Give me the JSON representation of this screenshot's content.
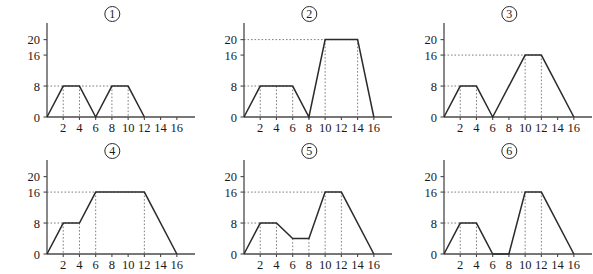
{
  "figure": {
    "panel_count": 6,
    "panel_labels": [
      "1",
      "2",
      "3",
      "4",
      "5",
      "6"
    ],
    "label_style": "circled-number"
  },
  "chart_data": [
    {
      "type": "line",
      "title": "1",
      "xlabel": "",
      "ylabel": "",
      "x": [
        0,
        2,
        4,
        6,
        8,
        10,
        12
      ],
      "y": [
        0,
        8,
        8,
        0,
        8,
        8,
        0
      ],
      "xticks": [
        2,
        4,
        6,
        8,
        10,
        12,
        14,
        16
      ],
      "yticks": [
        0,
        8,
        16,
        20
      ],
      "xlim": [
        0,
        17.5
      ],
      "ylim": [
        0,
        23
      ],
      "grid": false,
      "guide_lines_y": [
        8
      ],
      "guide_lines_x": [
        2,
        4,
        8,
        10
      ],
      "legend": ""
    },
    {
      "type": "line",
      "title": "2",
      "xlabel": "",
      "ylabel": "",
      "x": [
        0,
        2,
        6,
        8,
        10,
        14,
        16
      ],
      "y": [
        0,
        8,
        8,
        0,
        20,
        20,
        0
      ],
      "xticks": [
        2,
        4,
        6,
        8,
        10,
        12,
        14,
        16
      ],
      "yticks": [
        0,
        8,
        16,
        20
      ],
      "xlim": [
        0,
        17.5
      ],
      "ylim": [
        0,
        23
      ],
      "grid": false,
      "guide_lines_y": [
        8,
        20
      ],
      "guide_lines_x": [
        2,
        4,
        6,
        10,
        14
      ],
      "legend": ""
    },
    {
      "type": "line",
      "title": "3",
      "xlabel": "",
      "ylabel": "",
      "x": [
        0,
        2,
        4,
        6,
        10,
        12,
        16
      ],
      "y": [
        0,
        8,
        8,
        0,
        16,
        16,
        0
      ],
      "xticks": [
        2,
        4,
        6,
        8,
        10,
        12,
        14,
        16
      ],
      "yticks": [
        0,
        8,
        16,
        20
      ],
      "xlim": [
        0,
        17.5
      ],
      "ylim": [
        0,
        23
      ],
      "grid": false,
      "guide_lines_y": [
        8,
        16
      ],
      "guide_lines_x": [
        2,
        4,
        10,
        12
      ],
      "legend": ""
    },
    {
      "type": "line",
      "title": "4",
      "xlabel": "",
      "ylabel": "",
      "x": [
        0,
        2,
        4,
        6,
        12,
        16
      ],
      "y": [
        0,
        8,
        8,
        16,
        16,
        0
      ],
      "xticks": [
        2,
        4,
        6,
        8,
        10,
        12,
        14,
        16
      ],
      "yticks": [
        0,
        8,
        16,
        20
      ],
      "xlim": [
        0,
        17.5
      ],
      "ylim": [
        0,
        23
      ],
      "grid": false,
      "guide_lines_y": [
        8,
        16
      ],
      "guide_lines_x": [
        2,
        4,
        6,
        12
      ],
      "legend": ""
    },
    {
      "type": "line",
      "title": "5",
      "xlabel": "",
      "ylabel": "",
      "x": [
        0,
        2,
        4,
        6,
        8,
        10,
        12,
        16
      ],
      "y": [
        0,
        8,
        8,
        4,
        4,
        16,
        16,
        0
      ],
      "xticks": [
        2,
        4,
        6,
        8,
        10,
        12,
        14,
        16
      ],
      "yticks": [
        0,
        8,
        16,
        20
      ],
      "xlim": [
        0,
        17.5
      ],
      "ylim": [
        0,
        23
      ],
      "grid": false,
      "guide_lines_y": [
        8,
        16
      ],
      "guide_lines_x": [
        2,
        4,
        6,
        8,
        10,
        12
      ],
      "legend": ""
    },
    {
      "type": "line",
      "title": "6",
      "xlabel": "",
      "ylabel": "",
      "x": [
        0,
        2,
        4,
        6,
        8,
        10,
        12,
        16
      ],
      "y": [
        0,
        8,
        8,
        0,
        0,
        16,
        16,
        0
      ],
      "xticks": [
        2,
        4,
        6,
        8,
        10,
        12,
        14,
        16
      ],
      "yticks": [
        0,
        8,
        16,
        20
      ],
      "xlim": [
        0,
        17.5
      ],
      "ylim": [
        0,
        23
      ],
      "grid": false,
      "guide_lines_y": [
        8,
        16
      ],
      "guide_lines_x": [
        2,
        4,
        10,
        12
      ],
      "legend": ""
    }
  ]
}
